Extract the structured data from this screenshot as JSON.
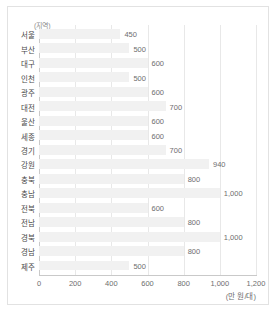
{
  "chart_data": {
    "type": "bar",
    "orientation": "horizontal",
    "title": "",
    "xlabel": "(만 원/대)",
    "ylabel": "(지역)",
    "categories": [
      "서울",
      "부산",
      "대구",
      "인천",
      "광주",
      "대전",
      "울산",
      "세종",
      "경기",
      "강원",
      "충북",
      "충남",
      "전북",
      "전남",
      "경북",
      "경남",
      "제주"
    ],
    "values": [
      450,
      500,
      600,
      500,
      600,
      700,
      600,
      600,
      700,
      940,
      800,
      1000,
      600,
      800,
      1000,
      800,
      500
    ],
    "value_labels": [
      "450",
      "500",
      "600",
      "500",
      "600",
      "700",
      "600",
      "600",
      "700",
      "940",
      "800",
      "1,000",
      "600",
      "800",
      "1,000",
      "800",
      "500"
    ],
    "xlim": [
      0,
      1200
    ],
    "xticks": [
      0,
      200,
      400,
      600,
      800,
      1000,
      1200
    ],
    "xtick_labels": [
      "0",
      "200",
      "400",
      "600",
      "800",
      "1,000",
      "1,200"
    ],
    "grid": true,
    "legend": "none",
    "bar_color": "#f1f1f1",
    "axis_color": "#c9c9c9",
    "grid_color": "#e8e8e8",
    "text_color": "#6e6e6e"
  }
}
